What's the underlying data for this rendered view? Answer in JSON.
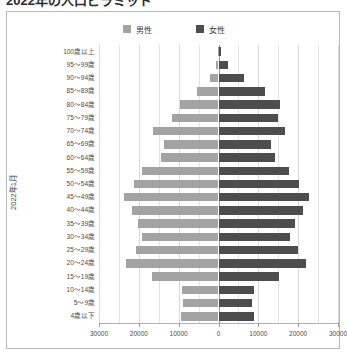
{
  "title": "2022年の人口ピラミッド",
  "colors": {
    "male": "#a3a3a3",
    "female": "#4d4d4d",
    "frame": "#b9b9b9",
    "grid": "#e2e2e2",
    "axis": "#b0b0b0",
    "text": "#4a4a4a",
    "background": "#ffffff"
  },
  "legend": {
    "position": "top-center",
    "entries": [
      {
        "label": "男性",
        "color": "#a3a3a3"
      },
      {
        "label": "女性",
        "color": "#4d4d4d"
      }
    ]
  },
  "axes": {
    "y_title": "2022年1月",
    "x_tick_labels": [
      "30000",
      "20000",
      "10000",
      "0",
      "10000",
      "20000",
      "30000"
    ],
    "x_tick_values": [
      -30000,
      -20000,
      -10000,
      0,
      10000,
      20000,
      30000
    ],
    "x_min": -30000,
    "x_max": 30000
  },
  "chart_data": {
    "type": "bar",
    "subtype": "population-pyramid",
    "title": "2022年の人口ピラミッド",
    "xlabel": "",
    "ylabel": "2022年1月",
    "xlim": [
      -30000,
      30000
    ],
    "grid": true,
    "legend_position": "top-center",
    "orientation": "horizontal",
    "categories": [
      "100歳以上",
      "95〜99歳",
      "90〜94歳",
      "85〜89歳",
      "80〜84歳",
      "75〜79歳",
      "70〜74歳",
      "65〜69歳",
      "60〜64歳",
      "55〜59歳",
      "50〜54歳",
      "45〜49歳",
      "40〜44歳",
      "35〜39歳",
      "30〜34歳",
      "25〜29歳",
      "20〜24歳",
      "15〜19歳",
      "10〜14歳",
      "5〜9歳",
      "4歳以下"
    ],
    "series": [
      {
        "name": "男性",
        "color": "#a3a3a3",
        "values": [
          200,
          600,
          2100,
          5400,
          9600,
          11700,
          16400,
          13800,
          14500,
          19200,
          21300,
          23600,
          21800,
          20200,
          19300,
          20800,
          23100,
          16600,
          9200,
          9000,
          9300
        ]
      },
      {
        "name": "女性",
        "color": "#4d4d4d",
        "values": [
          700,
          2400,
          6400,
          11600,
          15400,
          14900,
          16800,
          13300,
          14100,
          17800,
          20200,
          22700,
          21200,
          19100,
          17900,
          19900,
          21900,
          15300,
          8800,
          8500,
          8900
        ]
      }
    ]
  }
}
